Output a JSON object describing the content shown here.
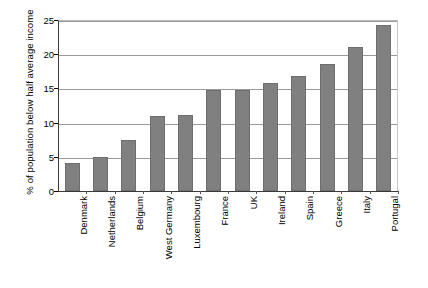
{
  "chart_data": {
    "type": "bar",
    "title": "",
    "subtitle": "",
    "xlabel": "",
    "ylabel": "% of population below half average income",
    "ylim": [
      0,
      25
    ],
    "yticks": [
      0,
      5,
      10,
      15,
      20,
      25
    ],
    "ytick_labels": [
      "0",
      "5",
      "10",
      "15",
      "20",
      "25"
    ],
    "grid": true,
    "legend": false,
    "legend_position": "none",
    "bar_color": "#808080",
    "bar_edge_color": "#6e6e6e",
    "gridline_color": "#9a9a9a",
    "axis_color": "#3a3a3a",
    "categories": [
      "Denmark",
      "Netherlands",
      "Belgium",
      "West Germany",
      "Luxembourg",
      "France",
      "UK",
      "Ireland",
      "Spain",
      "Greece",
      "Italy",
      "Portugal"
    ],
    "values": [
      4.1,
      5.0,
      7.5,
      10.9,
      11.1,
      14.7,
      14.7,
      15.8,
      16.8,
      18.5,
      21.0,
      24.3
    ]
  }
}
